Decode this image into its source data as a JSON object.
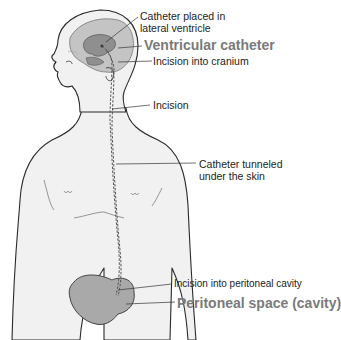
{
  "diagram": {
    "colors": {
      "skin": "#f1f1f1",
      "outline": "#2a2a2a",
      "brain": "#c4c4c4",
      "ventricle": "#8f8f8f",
      "peritoneum": "#a9a9a9",
      "emphasis_label": "#7a7a7a",
      "leader_line": "#333333"
    },
    "labels": [
      {
        "id": "catheter-lateral-ventricle",
        "lines": [
          "Catheter placed in",
          "lateral ventricle"
        ]
      },
      {
        "id": "ventricular-catheter",
        "text": "Ventricular catheter",
        "emphasis": true
      },
      {
        "id": "incision-cranium",
        "text": "Incision into cranium"
      },
      {
        "id": "incision",
        "text": "Incision"
      },
      {
        "id": "catheter-tunneled",
        "lines": [
          "Catheter tunneled",
          "under the skin"
        ]
      },
      {
        "id": "incision-peritoneal",
        "text": "Incision into peritoneal cavity"
      },
      {
        "id": "peritoneal-space",
        "text": "Peritoneal space (cavity)",
        "emphasis": true
      }
    ]
  }
}
